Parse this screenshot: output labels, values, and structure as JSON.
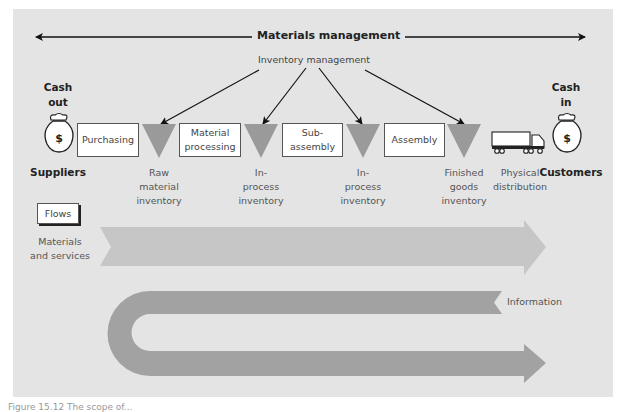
{
  "diagram": {
    "top_span": {
      "label": "Materials management",
      "direction": "both"
    },
    "inventory_management": {
      "label": "Inventory management",
      "arrows_to": [
        "raw_material_inventory",
        "in_process_inventory_1",
        "in_process_inventory_2",
        "finished_goods_inventory"
      ]
    },
    "left_end": {
      "cash_label_line1": "Cash",
      "cash_label_line2": "out",
      "icon": "money-bag-icon",
      "icon_symbol": "$",
      "party": "Suppliers"
    },
    "right_end": {
      "cash_label_line1": "Cash",
      "cash_label_line2": "in",
      "icon": "money-bag-icon",
      "icon_symbol": "$",
      "party": "Customers"
    },
    "process_boxes": [
      {
        "id": "purchasing",
        "line1": "Purchasing",
        "line2": ""
      },
      {
        "id": "material_processing",
        "line1": "Material",
        "line2": "processing"
      },
      {
        "id": "sub_assembly",
        "line1": "Sub-",
        "line2": "assembly"
      },
      {
        "id": "assembly",
        "line1": "Assembly",
        "line2": ""
      }
    ],
    "inventories": [
      {
        "id": "raw_material_inventory",
        "lines": [
          "Raw",
          "material",
          "inventory"
        ]
      },
      {
        "id": "in_process_inventory_1",
        "lines": [
          "In-",
          "process",
          "inventory"
        ]
      },
      {
        "id": "in_process_inventory_2",
        "lines": [
          "In-",
          "process",
          "inventory"
        ]
      },
      {
        "id": "finished_goods_inventory",
        "lines": [
          "Finished",
          "goods",
          "inventory"
        ]
      }
    ],
    "distribution": {
      "icon": "truck-icon",
      "lines": [
        "Physical",
        "distribution"
      ]
    },
    "flows": {
      "heading": "Flows",
      "materials": {
        "lines": [
          "Materials",
          "and services"
        ],
        "direction": "left-to-right"
      },
      "information": {
        "label": "Information",
        "direction": "U-turn: right-to-left then left-to-right"
      }
    },
    "colors": {
      "background": "#e4e4e4",
      "inventory_triangle": "#9a9a9a",
      "materials_arrow": "#c6c6c6",
      "information_arrow": "#a2a2a2",
      "box_fill": "#ffffff"
    },
    "caption": "Figure 15.12 The scope of..."
  }
}
